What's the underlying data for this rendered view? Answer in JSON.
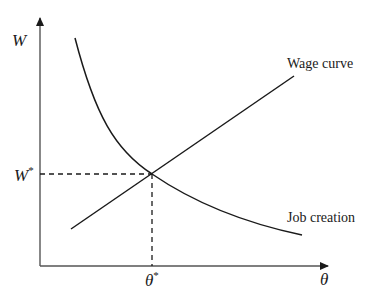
{
  "diagram": {
    "type": "economic-equilibrium",
    "axes": {
      "y_label": "W",
      "x_label": "θ"
    },
    "curves": [
      {
        "name": "Wage curve",
        "label": "Wage curve",
        "shape": "upward-sloping line"
      },
      {
        "name": "Job creation",
        "label": "Job creation",
        "shape": "downward-sloping convex curve"
      }
    ],
    "equilibrium": {
      "w_label": "W",
      "w_superscript": "*",
      "theta_label": "θ",
      "theta_superscript": "*"
    },
    "colors": {
      "line": "#1a1a1a",
      "axis": "#555555",
      "background": "#ffffff"
    }
  }
}
